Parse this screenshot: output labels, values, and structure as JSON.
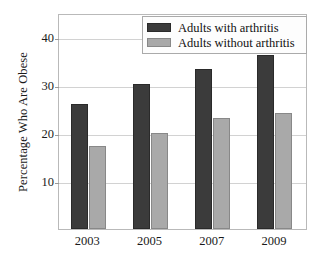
{
  "chart_data": {
    "type": "bar",
    "title": "",
    "subtitle": "",
    "xlabel": "",
    "ylabel": "Percentage Who Are Obese",
    "categories": [
      "2003",
      "2005",
      "2007",
      "2009"
    ],
    "series": [
      {
        "name": "Adults with arthritis",
        "color": "#3b3b3b",
        "values": [
          26.0,
          30.2,
          33.3,
          36.3
        ]
      },
      {
        "name": "Adults without arthritis",
        "color": "#a9a9a9",
        "values": [
          17.2,
          20.0,
          23.2,
          24.2
        ]
      }
    ],
    "ylim": [
      0,
      45
    ],
    "y_ticks": [
      10,
      20,
      30,
      40
    ],
    "y_tick_labels": [
      "10",
      "20",
      "30",
      "40"
    ],
    "grid": "horizontal",
    "legend_position": "top-right",
    "legend_entries": [
      "Adults with arthritis",
      "Adults without arthritis"
    ]
  },
  "legend": {
    "items": [
      {
        "label": "Adults with arthritis",
        "swatch": "dark-swatch-icon"
      },
      {
        "label": "Adults without arthritis",
        "swatch": "light-swatch-icon"
      }
    ]
  },
  "axes": {
    "y_title": "Percentage Who Are Obese",
    "y_ticks": [
      "10",
      "20",
      "30",
      "40"
    ],
    "x_ticks": [
      "2003",
      "2005",
      "2007",
      "2009"
    ]
  }
}
